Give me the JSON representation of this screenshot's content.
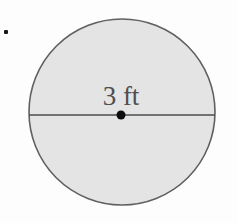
{
  "figure": {
    "type": "circle-with-diameter",
    "label": "3 ft",
    "diameter_value": 3,
    "diameter_unit": "ft",
    "colors": {
      "background": "#fdfdfd",
      "circle_fill": "#e4e4e4",
      "circle_stroke": "#606060",
      "diameter_line": "#4d4d4d",
      "center_dot": "#0d0d0d",
      "label_color": "#4f4f4f",
      "bullet_color": "#1a1a1a"
    }
  }
}
